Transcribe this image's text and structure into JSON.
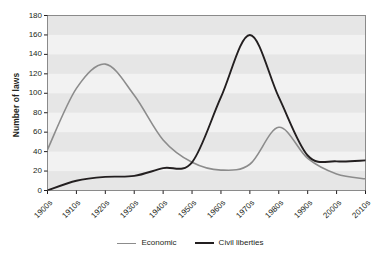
{
  "chart": {
    "y_axis_title": "Number of laws",
    "x_axis_title": "",
    "title": ""
  },
  "legend": {
    "position": "bottom-center",
    "items": [
      {
        "label": "Economic",
        "color": "#8c8c8c"
      },
      {
        "label": "Civil liberties",
        "color": "#231f20"
      }
    ]
  },
  "colors": {
    "economic": "#8c8c8c",
    "civil_liberties": "#231f20",
    "plot_background": "#f2f2f2",
    "band": "#e6e6e6",
    "axis": "#231f20",
    "text": "#231f20"
  },
  "chart_data": {
    "type": "line",
    "title": "",
    "xlabel": "",
    "ylabel": "Number of laws",
    "ylim": [
      0,
      180
    ],
    "y_ticks": [
      0,
      20,
      40,
      60,
      80,
      100,
      120,
      140,
      160,
      180
    ],
    "grid": false,
    "banded_background": true,
    "legend_position": "bottom-center",
    "categories": [
      "1900s",
      "1910s",
      "1920s",
      "1930s",
      "1940s",
      "1950s",
      "1960s",
      "1970s",
      "1980s",
      "1990s",
      "2000s",
      "2010s"
    ],
    "series": [
      {
        "name": "Economic",
        "color": "#8c8c8c",
        "values": [
          42,
          105,
          130,
          98,
          52,
          29,
          21,
          27,
          65,
          33,
          17,
          12
        ]
      },
      {
        "name": "Civil liberties",
        "color": "#231f20",
        "values": [
          0,
          10,
          14,
          15,
          23,
          29,
          96,
          160,
          96,
          36,
          30,
          31
        ]
      }
    ]
  }
}
